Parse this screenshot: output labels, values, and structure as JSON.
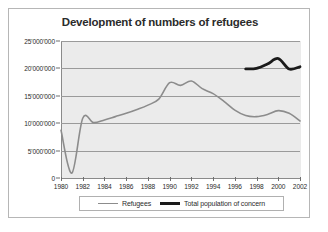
{
  "chart_data": {
    "type": "line",
    "title": "Development of numbers of refugees",
    "xlabel": "",
    "ylabel": "",
    "xlim": [
      1980,
      2002
    ],
    "ylim": [
      0,
      25000000
    ],
    "grid": true,
    "legend_position": "bottom",
    "y_ticks": [
      {
        "value": 25000000,
        "label": "25'000'000"
      },
      {
        "value": 20000000,
        "label": "20'000'000"
      },
      {
        "value": 15000000,
        "label": "15'000'000"
      },
      {
        "value": 10000000,
        "label": "10'000'000"
      },
      {
        "value": 5000000,
        "label": "5'000'000"
      },
      {
        "value": 0,
        "label": "0"
      }
    ],
    "x_ticks": [
      {
        "value": 1980,
        "label": "1980"
      },
      {
        "value": 1982,
        "label": "1982"
      },
      {
        "value": 1984,
        "label": "1984"
      },
      {
        "value": 1986,
        "label": "1986"
      },
      {
        "value": 1988,
        "label": "1988"
      },
      {
        "value": 1990,
        "label": "1990"
      },
      {
        "value": 1992,
        "label": "1992"
      },
      {
        "value": 1994,
        "label": "1994"
      },
      {
        "value": 1996,
        "label": "1996"
      },
      {
        "value": 1998,
        "label": "1998"
      },
      {
        "value": 2000,
        "label": "2000"
      },
      {
        "value": 2002,
        "label": "2002"
      }
    ],
    "series": [
      {
        "name": "Refugees",
        "color": "#8c8c8c",
        "width": 1.6,
        "x": [
          1980,
          1981,
          1982,
          1983,
          1984,
          1985,
          1986,
          1987,
          1988,
          1989,
          1990,
          1991,
          1992,
          1993,
          1994,
          1995,
          1996,
          1997,
          1998,
          1999,
          2000,
          2001,
          2002
        ],
        "values": [
          8700000,
          900000,
          10900000,
          10100000,
          10600000,
          11200000,
          11800000,
          12500000,
          13300000,
          14400000,
          17400000,
          16900000,
          17700000,
          16300000,
          15400000,
          14000000,
          12400000,
          11400000,
          11200000,
          11600000,
          12300000,
          11800000,
          10400000
        ]
      },
      {
        "name": "Total population of concern",
        "color": "#1a1a1a",
        "width": 2.8,
        "x": [
          1997,
          1998,
          1999,
          2000,
          2001,
          2002
        ],
        "values": [
          19900000,
          20000000,
          20800000,
          21800000,
          19900000,
          20300000
        ]
      }
    ]
  },
  "legend": {
    "items": [
      {
        "label": "Refugees"
      },
      {
        "label": "Total population of concern"
      }
    ]
  }
}
